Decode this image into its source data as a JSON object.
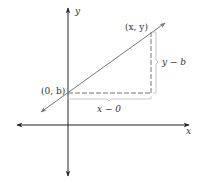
{
  "diagram": {
    "axes": {
      "x_label": "x",
      "y_label": "y",
      "color": "#222222"
    },
    "line": {
      "color": "#777777"
    },
    "points": {
      "intercept": {
        "label": "(0, b)"
      },
      "general": {
        "label": "(x, y)"
      }
    },
    "segments": {
      "rise_label": "y − b",
      "run_label": "x − 0",
      "dash_color": "#777777",
      "bracket_color": "#bbbbbb"
    }
  }
}
